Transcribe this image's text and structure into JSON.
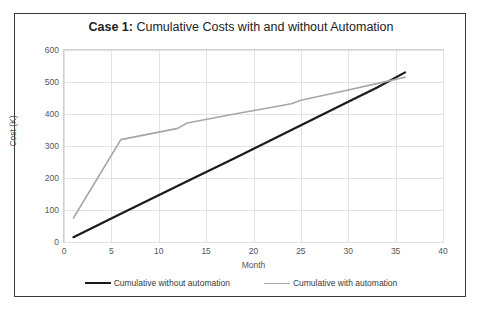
{
  "chart_data": {
    "type": "line",
    "title": "Case 1: Cumulative Costs with and without Automation",
    "title_bold_prefix": "Case 1:",
    "title_rest": " Cumulative Costs with and without Automation",
    "xlabel": "Month",
    "ylabel": "Cost (K)",
    "xlim": [
      0,
      40
    ],
    "ylim": [
      0,
      600
    ],
    "xticks": [
      0,
      5,
      10,
      15,
      20,
      25,
      30,
      35,
      40
    ],
    "yticks": [
      0,
      100,
      200,
      300,
      400,
      500,
      600
    ],
    "grid": true,
    "legend_position": "bottom",
    "series": [
      {
        "name": "Cumulative without automation",
        "color": "#1a1a1a",
        "width": 2.2,
        "x": [
          1,
          6,
          13,
          18,
          24,
          30,
          33,
          36
        ],
        "values": [
          15,
          88,
          190,
          262,
          350,
          438,
          482,
          530
        ]
      },
      {
        "name": "Cumulative with automation",
        "color": "#a6a6a6",
        "width": 1.6,
        "x": [
          1,
          6,
          12,
          13,
          18,
          24,
          25,
          30,
          33,
          36
        ],
        "values": [
          75,
          320,
          355,
          372,
          400,
          432,
          443,
          475,
          495,
          515
        ]
      }
    ],
    "crossover": {
      "month": 33.5,
      "cost": 490
    }
  },
  "legend": {
    "entries": [
      {
        "label": "Cumulative without automation",
        "color": "#1a1a1a",
        "thickness": "2.2px"
      },
      {
        "label": "Cumulative with automation",
        "color": "#a6a6a6",
        "thickness": "1.4px"
      }
    ]
  }
}
